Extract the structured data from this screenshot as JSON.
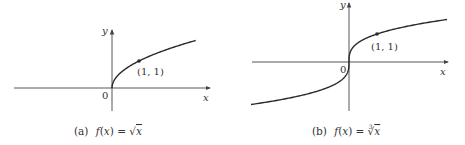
{
  "figure": {
    "panels": [
      {
        "id": "a",
        "caption_prefix": "(a)",
        "caption_func": "f(x) = ",
        "caption_radical": "√",
        "caption_index": "",
        "caption_arg": "x",
        "axis_x_label": "x",
        "axis_y_label": "y",
        "origin_label": "0",
        "point_label": "(1, 1)",
        "function": "sqrt"
      },
      {
        "id": "b",
        "caption_prefix": "(b)",
        "caption_func": "f(x) = ",
        "caption_radical": "√",
        "caption_index": "3",
        "caption_arg": "x",
        "axis_x_label": "x",
        "axis_y_label": "y",
        "origin_label": "0",
        "point_label": "(1, 1)",
        "function": "cbrt"
      }
    ],
    "colors": {
      "curve": "#2a2a2a",
      "axis": "#444444",
      "text": "#333333"
    }
  }
}
